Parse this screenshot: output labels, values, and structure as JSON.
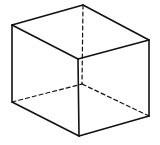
{
  "diagram": {
    "type": "wireframe-cube",
    "stroke_color": "#111111",
    "background": "#ffffff",
    "vertices": {
      "top_back": [
        83,
        5
      ],
      "top_left": [
        12,
        25
      ],
      "top_right": [
        149,
        40
      ],
      "top_front": [
        78,
        59
      ],
      "bottom_left": [
        12,
        102
      ],
      "bottom_front": [
        79,
        136
      ],
      "bottom_right": [
        149,
        116
      ],
      "bottom_back_hidden": [
        82,
        84
      ]
    },
    "visible_edges": [
      [
        "top_back",
        "top_left"
      ],
      [
        "top_back",
        "top_right"
      ],
      [
        "top_left",
        "top_front"
      ],
      [
        "top_right",
        "top_front"
      ],
      [
        "top_left",
        "bottom_left"
      ],
      [
        "top_front",
        "bottom_front"
      ],
      [
        "top_right",
        "bottom_right"
      ],
      [
        "bottom_left",
        "bottom_front"
      ],
      [
        "bottom_front",
        "bottom_right"
      ]
    ],
    "hidden_edges": [
      [
        "top_back",
        "bottom_back_hidden"
      ],
      [
        "bottom_left",
        "bottom_back_hidden"
      ],
      [
        "bottom_right",
        "bottom_back_hidden"
      ]
    ]
  }
}
